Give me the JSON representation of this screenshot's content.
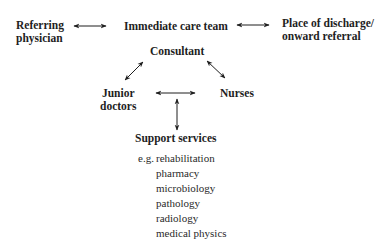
{
  "nodes": {
    "referring": [
      "Referring",
      "physician"
    ],
    "team": "Immediate care team",
    "discharge": [
      "Place of discharge/",
      "onward referral"
    ],
    "consultant": "Consultant",
    "junior": [
      "Junior",
      "doctors"
    ],
    "nurses": "Nurses",
    "support": "Support services"
  },
  "examples": {
    "prefix": "e.g.",
    "items": [
      "rehabilitation",
      "pharmacy",
      "microbiology",
      "pathology",
      "radiology",
      "medical physics"
    ]
  },
  "colors": {
    "text": "#1e1e1e",
    "arrow": "#1e1e1e"
  }
}
